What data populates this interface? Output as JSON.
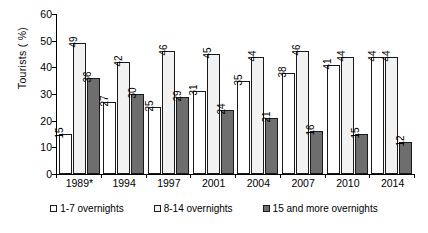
{
  "chart_data": {
    "type": "bar",
    "title": "",
    "xlabel": "",
    "ylabel": "Tourists ( %)",
    "ylim": [
      0,
      60
    ],
    "yticks": [
      0,
      10,
      20,
      30,
      40,
      50,
      60
    ],
    "grid": false,
    "legend_position": "bottom",
    "categories": [
      "1989*",
      "1994",
      "1997",
      "2001",
      "2004",
      "2007",
      "2010",
      "2014"
    ],
    "series": [
      {
        "name": "1-7 overnights",
        "color": "#ffffff",
        "values": [
          15,
          27,
          25,
          31,
          35,
          38,
          41,
          44
        ]
      },
      {
        "name": "8-14 overnights",
        "color": "#f2f2f2",
        "values": [
          49,
          42,
          46,
          45,
          44,
          46,
          44,
          44
        ]
      },
      {
        "name": "15 and more overnights",
        "color": "#6e6e6e",
        "values": [
          36,
          30,
          29,
          24,
          21,
          16,
          15,
          12
        ]
      }
    ]
  },
  "legend": {
    "items": [
      {
        "label": "1-7 overnights"
      },
      {
        "label": "8-14 overnights"
      },
      {
        "label": "15 and more overnights"
      }
    ]
  }
}
